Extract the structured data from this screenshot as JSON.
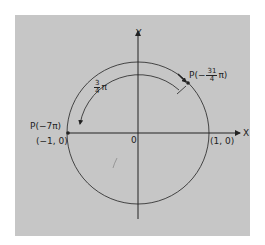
{
  "figure": {
    "background_color": "#c6c6c6",
    "line_color": "#222222",
    "axes": {
      "x_label": "X",
      "y_label": "Y",
      "origin_label": "0"
    },
    "points": {
      "right_intercept": "(1, 0)",
      "left_intercept": "(−1, 0)",
      "p_left": {
        "prefix": "P(−7π)"
      },
      "p_upper": {
        "prefix": "P(−",
        "num": "31",
        "den": "4",
        "suffix": "π)"
      }
    },
    "arc_label": {
      "num": "3",
      "den": "4",
      "suffix": "π"
    }
  }
}
